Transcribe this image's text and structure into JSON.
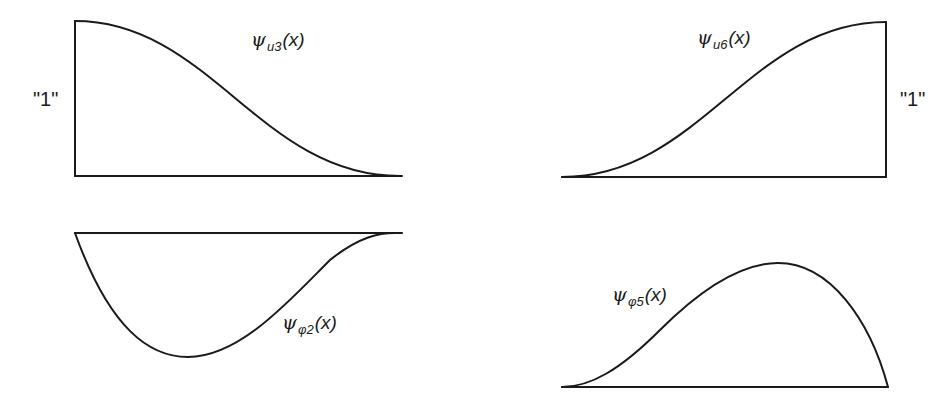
{
  "figure": {
    "panels": [
      {
        "id": "top-left",
        "function": {
          "symbol": "ψ",
          "subscript": "u3",
          "argument": "(x)"
        },
        "unit_label": "\"1\"",
        "description": "Starts at value 1 at left end with zero slope, decreases smoothly to 0 at right end with zero slope"
      },
      {
        "id": "top-right",
        "function": {
          "symbol": "ψ",
          "subscript": "u6",
          "argument": "(x)"
        },
        "unit_label": "\"1\"",
        "description": "Starts at 0 at left end with zero slope, increases smoothly to value 1 at right end with zero slope"
      },
      {
        "id": "bottom-left",
        "function": {
          "symbol": "ψ",
          "subscript": "φ2",
          "argument": "(x)"
        },
        "description": "Starts at 0 with steep negative slope, reaches minimum near one-third span, returns to 0 with zero slope at right end"
      },
      {
        "id": "bottom-right",
        "function": {
          "symbol": "ψ",
          "subscript": "φ5",
          "argument": "(x)"
        },
        "description": "Starts at 0 with zero slope, reaches maximum near two-thirds span, returns to 0 with steep negative slope at right end"
      }
    ],
    "colors": {
      "line": "#1a1a1a",
      "background": "#ffffff"
    }
  }
}
